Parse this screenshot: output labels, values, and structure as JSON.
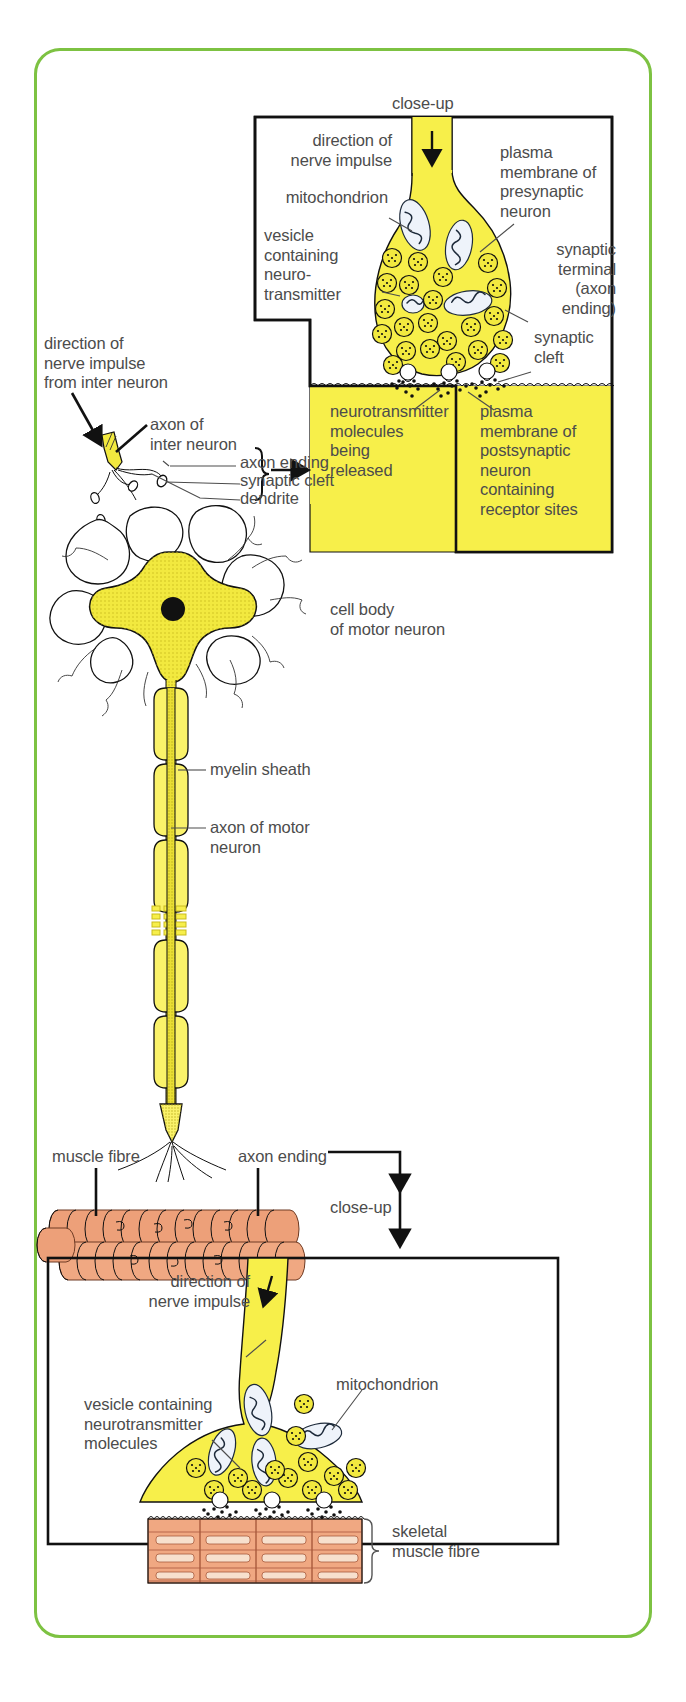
{
  "figure": {
    "frame_color": "#7dc242",
    "cytoplasm_color": "#f7ef4a",
    "muscle_color": "#f0a882"
  },
  "top_closeup": {
    "caption": "close-up",
    "labels": {
      "direction": "direction of\nnerve impulse",
      "mitochondrion": "mitochondrion",
      "vesicle": "vesicle\ncontaining\nneuro-\ntransmitter",
      "plasma_membrane_pre": "plasma\nmembrane of\npresynaptic\nneuron",
      "synaptic_terminal": "synaptic\nterminal\n(axon\nending)",
      "synaptic_cleft": "synaptic\ncleft",
      "neurotransmitter_released": "neurotransmitter\nmolecules\nbeing\nreleased",
      "plasma_membrane_post": "plasma\nmembrane of\npostsynaptic\nneuron\ncontaining\nreceptor sites"
    }
  },
  "neuron": {
    "labels": {
      "impulse_in": "direction of\nnerve impulse\nfrom inter neuron",
      "axon_of_inter": "axon of\ninter neuron",
      "axon_ending": "axon ending",
      "synaptic_cleft": "synaptic cleft",
      "dendrite": "dendrite",
      "cell_body": "cell body\nof motor neuron",
      "myelin_sheath": "myelin sheath",
      "axon_of_motor": "axon of motor\nneuron",
      "muscle_fibre": "muscle fibre",
      "axon_ending_lower": "axon ending"
    }
  },
  "bottom_closeup": {
    "caption": "close-up",
    "labels": {
      "direction": "direction of\nnerve impulse",
      "mitochondrion": "mitochondrion",
      "vesicle": "vesicle containing\nneurotransmitter\nmolecules",
      "skeletal_muscle_fibre": "skeletal\nmuscle fibre"
    }
  }
}
